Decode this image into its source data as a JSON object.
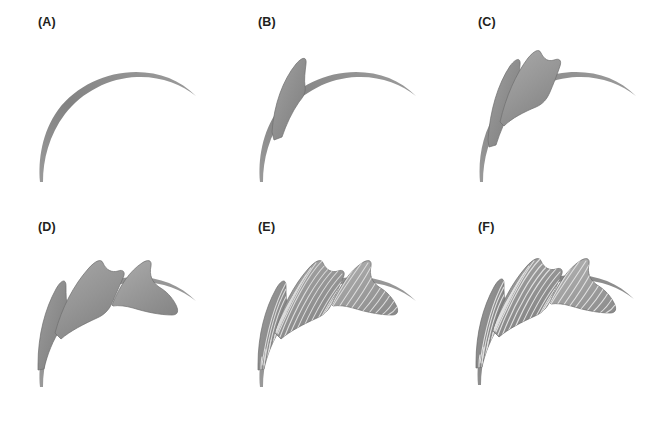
{
  "figure": {
    "type": "multi-panel-illustration",
    "background_color": "#ffffff",
    "panel_count": 6,
    "rows": 2,
    "columns": 3,
    "width": 661,
    "height": 424
  },
  "colors": {
    "rachis": "#8d8d8d",
    "rachis_dark": "#7a7a7a",
    "blade_fill": "#949494",
    "blade_fill_light": "#a6a6a6",
    "blade_fill_dark": "#808080",
    "blade_edge": "#6f6f6f",
    "vein_line": "#d8d8d8",
    "label_text": "#231f20"
  },
  "panels": [
    {
      "id": "A",
      "label": "(A)",
      "stage": 1,
      "description": "bare curved rachis only",
      "leaflet_count": 0,
      "veins": false
    },
    {
      "id": "B",
      "label": "(B)",
      "stage": 2,
      "description": "rachis with first basal leaflet blade",
      "leaflet_count": 1,
      "veins": false
    },
    {
      "id": "C",
      "label": "(C)",
      "stage": 3,
      "description": "rachis with two leaflet blades",
      "leaflet_count": 2,
      "veins": false
    },
    {
      "id": "D",
      "label": "(D)",
      "stage": 4,
      "description": "rachis with three leaflet blades spanning the full arc",
      "leaflet_count": 3,
      "veins": false
    },
    {
      "id": "E",
      "label": "(E)",
      "stage": 5,
      "description": "three leaflets with parallel vein striations added",
      "leaflet_count": 3,
      "veins": true
    },
    {
      "id": "F",
      "label": "(F)",
      "stage": 6,
      "description": "finished frond with full venation and shading",
      "leaflet_count": 3,
      "veins": true
    }
  ]
}
